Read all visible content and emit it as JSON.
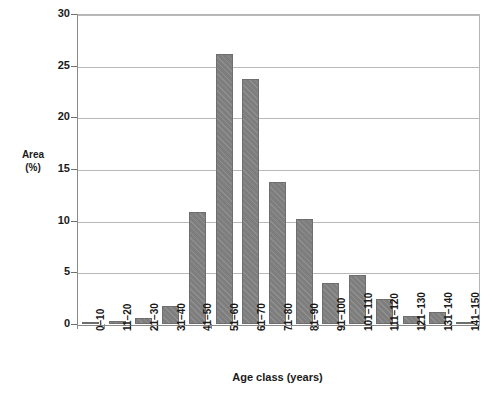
{
  "chart_data": {
    "type": "bar",
    "title": "",
    "subtitle": "",
    "xlabel": "Age class (years)",
    "ylabel_lines": [
      "Area",
      "(%)"
    ],
    "ylabel": "Area (%)",
    "categories": [
      "0–10",
      "11–20",
      "21–30",
      "31–40",
      "41–50",
      "51–60",
      "61–70",
      "71–80",
      "81–90",
      "91–100",
      "101–110",
      "111–120",
      "121–130",
      "131–140",
      "141–150"
    ],
    "values": [
      0.1,
      0.3,
      0.6,
      1.7,
      10.8,
      26.1,
      23.7,
      13.7,
      10.2,
      4.0,
      4.7,
      2.4,
      0.8,
      1.2,
      0.05
    ],
    "ylim": [
      0,
      30
    ],
    "yticks": [
      0,
      5,
      10,
      15,
      20,
      25,
      30
    ],
    "ytick_labels": [
      "0",
      "5",
      "10",
      "15",
      "20",
      "25",
      "30"
    ],
    "grid": true,
    "grid_axis": "y",
    "legend": false,
    "legend_position": "none",
    "bar_color": "#7e7e7e",
    "bar_pattern": "diagonal-hatch",
    "grid_color": "#b9b9b9",
    "axis_color": "#8a8a8a",
    "text_color": "#1a1a1a"
  }
}
